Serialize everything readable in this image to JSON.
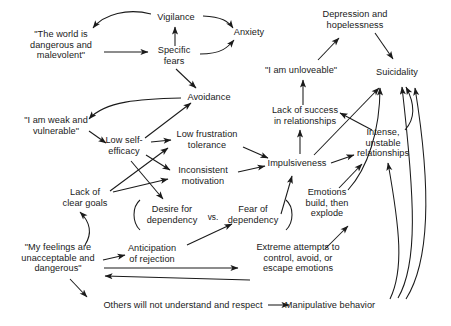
{
  "diagram": {
    "type": "concept-map",
    "background": "#ffffff",
    "ink": "#1a1a1a",
    "nodes": [
      {
        "id": "world_dangerous",
        "label": "\"The world is\ndangerous and\nmalevolent\"",
        "x": 61,
        "y": 45
      },
      {
        "id": "vigilance",
        "label": "Vigilance",
        "x": 176,
        "y": 17
      },
      {
        "id": "specific_fears",
        "label": "Specific\nfears",
        "x": 174,
        "y": 56
      },
      {
        "id": "anxiety",
        "label": "Anxiety",
        "x": 249,
        "y": 32
      },
      {
        "id": "depression",
        "label": "Depression and\nhopelessness",
        "x": 355,
        "y": 20
      },
      {
        "id": "unloveable",
        "label": "\"I am unloveable\"",
        "x": 301,
        "y": 70
      },
      {
        "id": "suicidality",
        "label": "Suicidality",
        "x": 397,
        "y": 72
      },
      {
        "id": "weak_vulnerable",
        "label": "\"I am weak and\nvulnerable\"",
        "x": 56,
        "y": 126
      },
      {
        "id": "avoidance",
        "label": "Avoidance",
        "x": 209,
        "y": 97
      },
      {
        "id": "low_self_efficacy",
        "label": "Low self-\nefficacy",
        "x": 124,
        "y": 146
      },
      {
        "id": "low_frustration",
        "label": "Low frustration\ntolerance",
        "x": 207,
        "y": 140
      },
      {
        "id": "lack_success",
        "label": "Lack of success\nin relationships",
        "x": 305,
        "y": 116
      },
      {
        "id": "inconsistent_motivation",
        "label": "Inconsistent\nmotivation",
        "x": 203,
        "y": 176
      },
      {
        "id": "impulsiveness",
        "label": "Impulsiveness",
        "x": 297,
        "y": 163
      },
      {
        "id": "intense_unstable",
        "label": "Intense,\nunstable\nrelationships",
        "x": 383,
        "y": 143
      },
      {
        "id": "lack_clear_goals",
        "label": "Lack of\nclear goals",
        "x": 85,
        "y": 198
      },
      {
        "id": "desire_dependency",
        "label": "Desire for\ndependency",
        "x": 172,
        "y": 215
      },
      {
        "id": "fear_dependency",
        "label": "Fear of\ndependency",
        "x": 253,
        "y": 215
      },
      {
        "id": "emotions_explode",
        "label": "Emotions\nbuild, then\nexplode",
        "x": 327,
        "y": 203
      },
      {
        "id": "my_feelings",
        "label": "\"My feelings are\nunacceptable and\ndangerous\"",
        "x": 58,
        "y": 258
      },
      {
        "id": "anticipation_rejection",
        "label": "Anticipation\nof rejection",
        "x": 152,
        "y": 254
      },
      {
        "id": "extreme_attempts",
        "label": "Extreme attempts to\ncontrol, avoid, or\nescape emotions",
        "x": 298,
        "y": 258
      },
      {
        "id": "others_not_understand",
        "label": "Others will not understand and respect",
        "x": 183,
        "y": 305,
        "wide": true
      },
      {
        "id": "manipulative",
        "label": "Manipulative behavior",
        "x": 330,
        "y": 305,
        "wide": true
      }
    ],
    "vs_label": {
      "text": "vs.",
      "x": 213,
      "y": 217
    },
    "brackets": [
      {
        "id": "left-paren",
        "x": 133,
        "y": 214
      },
      {
        "id": "right-paren",
        "x": 293,
        "y": 214
      }
    ],
    "edges": [
      {
        "from": "vigilance",
        "to": "world_dangerous",
        "style": "curve"
      },
      {
        "from": "world_dangerous",
        "to": "specific_fears",
        "style": "straight"
      },
      {
        "from": "specific_fears",
        "to": "vigilance",
        "style": "straight"
      },
      {
        "from": "vigilance",
        "to": "anxiety",
        "style": "curve"
      },
      {
        "from": "specific_fears",
        "to": "anxiety",
        "style": "curve"
      },
      {
        "from": "specific_fears",
        "to": "avoidance",
        "style": "straight"
      },
      {
        "from": "avoidance",
        "to": "weak_vulnerable",
        "style": "curve"
      },
      {
        "from": "weak_vulnerable",
        "to": "low_self_efficacy",
        "style": "straight"
      },
      {
        "from": "low_self_efficacy",
        "to": "avoidance",
        "style": "straight"
      },
      {
        "from": "low_self_efficacy",
        "to": "low_frustration",
        "style": "straight"
      },
      {
        "from": "low_self_efficacy",
        "to": "inconsistent_motivation",
        "style": "straight"
      },
      {
        "from": "low_self_efficacy",
        "to": "desire_dependency",
        "style": "straight"
      },
      {
        "from": "lack_clear_goals",
        "to": "low_frustration",
        "style": "straight"
      },
      {
        "from": "lack_clear_goals",
        "to": "inconsistent_motivation",
        "style": "straight"
      },
      {
        "from": "low_frustration",
        "to": "impulsiveness",
        "style": "straight"
      },
      {
        "from": "inconsistent_motivation",
        "to": "impulsiveness",
        "style": "straight"
      },
      {
        "from": "impulsiveness",
        "to": "lack_success",
        "style": "straight"
      },
      {
        "from": "lack_success",
        "to": "unloveable",
        "style": "straight"
      },
      {
        "from": "unloveable",
        "to": "depression",
        "style": "straight"
      },
      {
        "from": "depression",
        "to": "suicidality",
        "style": "straight"
      },
      {
        "from": "impulsiveness",
        "to": "suicidality",
        "style": "straight"
      },
      {
        "from": "impulsiveness",
        "to": "intense_unstable",
        "style": "straight"
      },
      {
        "from": "intense_unstable",
        "to": "lack_success",
        "style": "straight"
      },
      {
        "from": "intense_unstable",
        "to": "suicidality",
        "style": "curve"
      },
      {
        "from": "fear_dependency",
        "to": "impulsiveness",
        "style": "straight"
      },
      {
        "from": "anticipation_rejection",
        "to": "fear_dependency",
        "style": "straight"
      },
      {
        "from": "my_feelings",
        "to": "anticipation_rejection",
        "style": "straight"
      },
      {
        "from": "my_feelings",
        "to": "lack_clear_goals",
        "style": "curve"
      },
      {
        "from": "my_feelings",
        "to": "extreme_attempts",
        "style": "straight"
      },
      {
        "from": "my_feelings",
        "to": "others_not_understand",
        "style": "straight"
      },
      {
        "from": "extreme_attempts",
        "to": "my_feelings",
        "style": "straight"
      },
      {
        "from": "emotions_explode",
        "to": "intense_unstable",
        "style": "straight"
      },
      {
        "from": "emotions_explode",
        "to": "suicidality",
        "style": "curve"
      },
      {
        "from": "extreme_attempts",
        "to": "emotions_explode",
        "style": "straight"
      },
      {
        "from": "manipulative",
        "to": "emotions_explode",
        "style": "curve"
      },
      {
        "from": "manipulative",
        "to": "intense_unstable",
        "style": "curve"
      },
      {
        "from": "manipulative",
        "to": "suicidality",
        "style": "curve"
      },
      {
        "from": "others_not_understand",
        "to": "manipulative",
        "style": "straight"
      }
    ]
  }
}
